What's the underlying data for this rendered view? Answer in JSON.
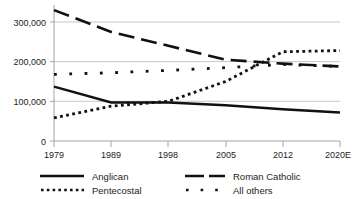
{
  "chart_data": {
    "type": "line",
    "title": "",
    "subtitle": "",
    "xlabel": "",
    "ylabel": "",
    "categories": [
      "1979",
      "1989",
      "1998",
      "2005",
      "2012",
      "2020E"
    ],
    "ylim": [
      0,
      350000
    ],
    "yticks": [
      0,
      100000,
      200000,
      300000
    ],
    "ytick_labels": [
      "0",
      "100,000",
      "200,000",
      "300,000"
    ],
    "grid": true,
    "grid_axis": "y",
    "legend_position": "bottom",
    "legend_columns": 2,
    "series": [
      {
        "name": "Anglican",
        "style": "solid",
        "color": "#111111",
        "values": [
          137000,
          97000,
          97000,
          90000,
          80000,
          72000
        ]
      },
      {
        "name": "Pentecostal",
        "style": "dotted",
        "color": "#111111",
        "values": [
          58000,
          88000,
          100000,
          150000,
          225000,
          228000
        ]
      },
      {
        "name": "Roman Catholic",
        "style": "dashed",
        "color": "#111111",
        "values": [
          330000,
          275000,
          240000,
          205000,
          195000,
          188000
        ]
      },
      {
        "name": "All others",
        "style": "sparse-dotted",
        "color": "#111111",
        "values": [
          168000,
          172000,
          178000,
          185000,
          193000,
          188000
        ]
      }
    ]
  },
  "legend": {
    "items": [
      {
        "label": "Anglican",
        "swatch": "solid-line-swatch"
      },
      {
        "label": "Roman Catholic",
        "swatch": "dashed-line-swatch"
      },
      {
        "label": "Pentecostal",
        "swatch": "dotted-line-swatch"
      },
      {
        "label": "All others",
        "swatch": "sparse-dotted-line-swatch"
      }
    ]
  }
}
